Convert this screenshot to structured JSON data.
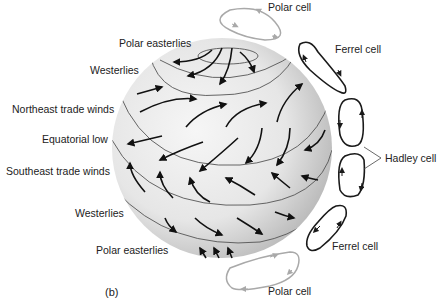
{
  "diagram": {
    "panel_label": "(b)",
    "wind_labels": [
      {
        "text": "Polar easterlies"
      },
      {
        "text": "Westerlies"
      },
      {
        "text": "Northeast trade winds"
      },
      {
        "text": "Equatorial low"
      },
      {
        "text": "Southeast trade winds"
      },
      {
        "text": "Westerlies"
      },
      {
        "text": "Polar easterlies"
      }
    ],
    "cell_labels": {
      "polar_north": "Polar cell",
      "ferrel_north": "Ferrel cell",
      "hadley": "Hadley cell",
      "ferrel_south": "Ferrel cell",
      "polar_south": "Polar cell"
    },
    "colors": {
      "globe_light": "#f2f2f2",
      "globe_dark": "#b8b8b8",
      "arrow": "#111111",
      "polar_cell": "#a9a9a9",
      "ferrel_cell": "#1a1a1a",
      "hadley_cell": "#1a1a1a"
    }
  }
}
